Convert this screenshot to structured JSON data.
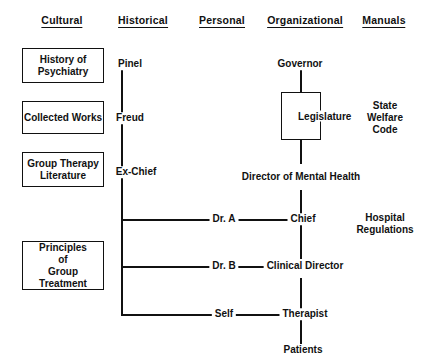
{
  "diagram": {
    "columns": [
      {
        "label": "Cultural"
      },
      {
        "label": "Historical"
      },
      {
        "label": "Personal"
      },
      {
        "label": "Organizational"
      },
      {
        "label": "Manuals"
      }
    ],
    "cultural_boxes": [
      {
        "label": "History of\nPsychiatry"
      },
      {
        "label": "Collected Works"
      },
      {
        "label": "Group Therapy\nLiterature"
      },
      {
        "label": "Principles\nof\nGroup Treatment"
      }
    ],
    "historical_nodes": [
      {
        "label": "Pinel"
      },
      {
        "label": "Freud"
      },
      {
        "label": "Ex-Chief"
      }
    ],
    "personal_nodes": [
      {
        "label": "Dr. A"
      },
      {
        "label": "Dr. B"
      },
      {
        "label": "Self"
      }
    ],
    "organizational_nodes": [
      {
        "label": "Governor"
      },
      {
        "label": "Legislature"
      },
      {
        "label": "Director of\nMental Health"
      },
      {
        "label": "Chief"
      },
      {
        "label": "Clinical\nDirector"
      },
      {
        "label": "Therapist"
      },
      {
        "label": "Patients"
      }
    ],
    "manuals": [
      {
        "label": "State\nWelfare\nCode"
      },
      {
        "label": "Hospital\nRegulations"
      }
    ],
    "colors": {
      "ink": "#111111",
      "background": "#ffffff"
    }
  }
}
